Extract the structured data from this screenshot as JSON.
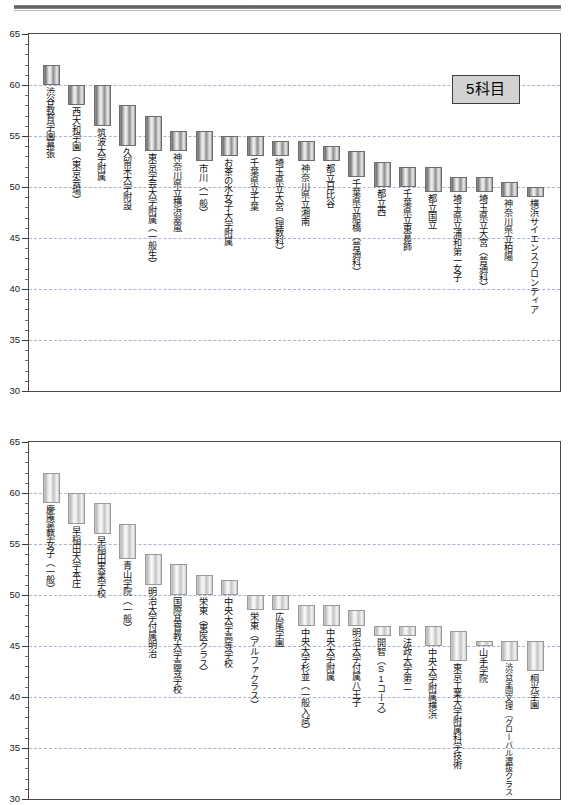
{
  "page": {
    "background": "#ffffff",
    "header_rule": true
  },
  "charts": [
    {
      "id": "chart-5kamoku",
      "legend_label": "5科目",
      "legend_bg": "#d2d2d2"
    },
    {
      "id": "chart-3kamoku",
      "legend_label": "3科目",
      "legend_bg": "#fafafa"
    }
  ],
  "chart_data": [
    {
      "type": "bar",
      "title": "5科目",
      "subtitle": "",
      "xlabel": "",
      "ylabel": "",
      "ylim": [
        30,
        65
      ],
      "ytick_major": [
        30,
        35,
        40,
        45,
        50,
        55,
        60,
        65
      ],
      "ytick_minor_step": 1,
      "grid": true,
      "grid_axis": "y",
      "legend_position": "top-right",
      "bar_style": "floating-range",
      "note": "Each bar is a floating range bar spanning [low, high] deviation-value.",
      "categories": [
        "渋谷教育学園幕張",
        "西大和学園（東京会場）",
        "筑波大学附属",
        "久留米大学附設",
        "東京学芸大学附属（一般生）",
        "神奈川県立横浜翠嵐",
        "市川（一般）",
        "お茶の水女子大学附属",
        "千葉県立千葉",
        "埼玉県立大宮（理数科）",
        "神奈川県立湘南",
        "都立日比谷",
        "千葉県立船橋（普通科）",
        "都立西",
        "千葉県立東葛飾",
        "都立国立",
        "埼玉県立浦和第一女子",
        "埼玉県立大宮（普通科）",
        "神奈川県立柏陽",
        "横浜サイエンスフロンティア"
      ],
      "low": [
        60.0,
        58.0,
        56.0,
        54.0,
        53.5,
        53.5,
        52.5,
        53.0,
        53.0,
        53.0,
        52.5,
        52.5,
        51.0,
        50.0,
        50.0,
        49.5,
        49.5,
        49.5,
        49.0,
        49.0
      ],
      "high": [
        62.0,
        60.0,
        60.0,
        58.0,
        57.0,
        55.5,
        55.5,
        55.0,
        55.0,
        54.5,
        54.5,
        54.0,
        53.5,
        52.5,
        52.0,
        52.0,
        51.0,
        51.0,
        50.5,
        50.0
      ]
    },
    {
      "type": "bar",
      "title": "3科目",
      "subtitle": "",
      "xlabel": "",
      "ylabel": "",
      "ylim": [
        30,
        65
      ],
      "ytick_major": [
        30,
        35,
        40,
        45,
        50,
        55,
        60,
        65
      ],
      "ytick_minor_step": 1,
      "grid": true,
      "grid_axis": "y",
      "legend_position": "top-right",
      "bar_style": "floating-range",
      "note": "Each bar is a floating range bar spanning [low, high] deviation-value.",
      "categories": [
        "慶應義塾女子（一般）",
        "早稲田大学本庄",
        "早稲田実業学校",
        "青山学院（一般）",
        "明治大学付属明治",
        "国際基督教大学高等学校",
        "栄東（東医クラス）",
        "中央大学高等学校",
        "栄東（アルファクラス）",
        "広尾学園",
        "中央大学杉並（一般入試）",
        "中央大学附属",
        "明治大学付属八王子",
        "開智（S1コース）",
        "法政大学第二",
        "中央大学附属横浜",
        "東京工業大学附属科学技術",
        "山手学院",
        "渋谷学園文理（グローバル選抜クラス・普通科）",
        "桐光学園"
      ],
      "low": [
        59.0,
        57.0,
        56.0,
        53.5,
        51.0,
        50.0,
        50.0,
        50.0,
        48.5,
        48.5,
        47.0,
        47.0,
        47.0,
        46.0,
        46.0,
        45.0,
        43.5,
        45.0,
        43.5,
        42.5
      ],
      "high": [
        62.0,
        60.0,
        59.0,
        57.0,
        54.0,
        53.0,
        52.0,
        51.5,
        50.0,
        50.0,
        49.0,
        49.0,
        48.5,
        47.0,
        47.0,
        47.0,
        46.5,
        45.5,
        45.5,
        45.5
      ]
    }
  ]
}
